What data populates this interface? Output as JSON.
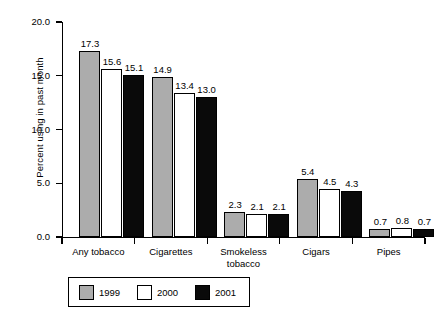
{
  "chart_data": {
    "type": "bar",
    "title": "",
    "subtitle": "",
    "xlabel": "",
    "ylabel": "Percent using in past month",
    "ylim": [
      0.0,
      20.0
    ],
    "ytick_labels": [
      "0.0",
      "5.0",
      "10.0",
      "15.0",
      "20.0"
    ],
    "ytick_values": [
      0.0,
      5.0,
      10.0,
      15.0,
      20.0
    ],
    "grid": false,
    "legend_position": "bottom-left",
    "categories": [
      "Any tobacco",
      "Cigarettes",
      "Smokeless tobacco",
      "Cigars",
      "Pipes"
    ],
    "series": [
      {
        "name": "1999",
        "color": "#acacac",
        "values": [
          17.3,
          14.9,
          2.3,
          5.4,
          0.7
        ]
      },
      {
        "name": "2000",
        "color": "#ffffff",
        "values": [
          15.6,
          13.4,
          2.1,
          4.5,
          0.8
        ]
      },
      {
        "name": "2001",
        "color": "#0a0a0a",
        "values": [
          15.1,
          13.0,
          2.1,
          4.3,
          0.7
        ]
      }
    ],
    "data_labels": [
      [
        "17.3",
        "15.6",
        "15.1"
      ],
      [
        "14.9",
        "13.4",
        "13.0"
      ],
      [
        "2.3",
        "2.1",
        "2.1"
      ],
      [
        "5.4",
        "4.5",
        "4.3"
      ],
      [
        "0.7",
        "0.8",
        "0.7"
      ]
    ],
    "category_label_lines": [
      [
        "Any tobacco"
      ],
      [
        "Cigarettes"
      ],
      [
        "Smokeless",
        "tobacco"
      ],
      [
        "Cigars"
      ],
      [
        "Pipes"
      ]
    ]
  },
  "legend": {
    "items": [
      {
        "label": "1999",
        "swatch": "s1999"
      },
      {
        "label": "2000",
        "swatch": "s2000"
      },
      {
        "label": "2001",
        "swatch": "s2001"
      }
    ]
  },
  "caption": {
    "clipped_text": ""
  }
}
